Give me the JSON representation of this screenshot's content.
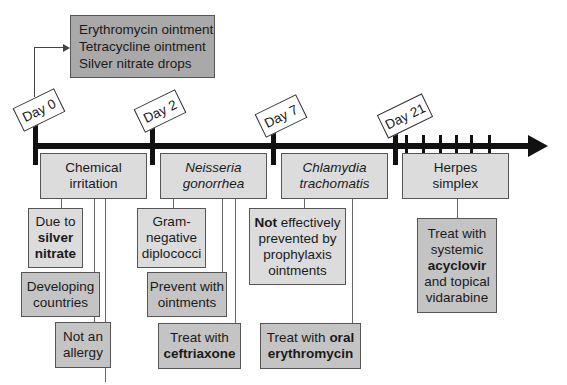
{
  "prophylaxis_box": {
    "lines": [
      "Erythromycin ointment",
      "Tetracycline ointment",
      "Silver nitrate drops"
    ]
  },
  "timeline": {
    "markers": [
      {
        "label": "Day 0"
      },
      {
        "label": "Day 2"
      },
      {
        "label": "Day 7"
      },
      {
        "label": "Day 21"
      }
    ]
  },
  "columns": [
    {
      "title": [
        "Chemical",
        "irritation"
      ],
      "title_style": "normal",
      "notes": [
        {
          "parts": [
            "Due to",
            "silver",
            "nitrate"
          ]
        },
        {
          "parts": [
            "Developing",
            "countries"
          ]
        },
        {
          "parts": [
            "Not an",
            "allergy"
          ]
        }
      ]
    },
    {
      "title": [
        "Neisseria",
        "gonorrhea"
      ],
      "title_style": "italic",
      "notes": [
        {
          "parts": [
            "Gram-",
            "negative",
            "diplococci"
          ]
        },
        {
          "parts": [
            "Prevent with",
            "ointments"
          ]
        },
        {
          "parts": [
            "Treat with",
            "ceftriaxone"
          ]
        }
      ]
    },
    {
      "title": [
        "Chlamydia",
        "trachomatis"
      ],
      "title_style": "italic",
      "notes": [
        {
          "parts": [
            "Not",
            " effectively",
            "prevented by",
            "prophylaxis",
            "ointments"
          ]
        },
        {
          "parts": [
            "Treat with ",
            "oral",
            "erythromycin"
          ]
        }
      ]
    },
    {
      "title": [
        "Herpes",
        "simplex"
      ],
      "title_style": "normal",
      "notes": [
        {
          "parts": [
            "Treat with",
            "systemic",
            "acyclovir",
            "and topical",
            "vidarabine"
          ]
        }
      ]
    }
  ]
}
